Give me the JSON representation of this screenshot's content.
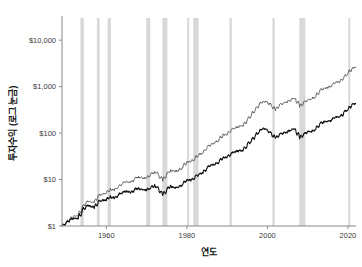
{
  "chart_data": {
    "type": "line",
    "title": "",
    "xlabel": "연도",
    "ylabel": "투자수익 (로그 눈금)",
    "yscale": "log",
    "xlim": [
      1949,
      2022
    ],
    "ylim": [
      1,
      30000
    ],
    "grid": false,
    "legend": "none",
    "y_tick_labels": [
      "$1",
      "$10",
      "$100",
      "$1,000",
      "$10,000"
    ],
    "y_tick_values": [
      1,
      10,
      100,
      1000,
      10000
    ],
    "x_tick_labels": [
      "1960",
      "1980",
      "2000",
      "2020"
    ],
    "x_tick_values": [
      1960,
      1980,
      2000,
      2020
    ],
    "colors": {
      "total_return": "#111111",
      "price_return": "#5a5a5a",
      "recession_band": "#d8d8d8",
      "axis": "#8a8a8a",
      "background": "#ffffff"
    },
    "series": [
      {
        "name": "total-return",
        "color": "#555555",
        "width": 0.9,
        "x": [
          1949.0,
          1950.0,
          1951.0,
          1952.0,
          1953.0,
          1954.0,
          1955.0,
          1956.0,
          1957.0,
          1958.0,
          1959.0,
          1960.0,
          1961.0,
          1962.0,
          1963.0,
          1964.0,
          1965.0,
          1966.0,
          1967.0,
          1968.0,
          1969.0,
          1970.0,
          1971.0,
          1972.0,
          1973.0,
          1974.0,
          1975.0,
          1976.0,
          1977.0,
          1978.0,
          1979.0,
          1980.0,
          1981.0,
          1982.0,
          1983.0,
          1984.0,
          1985.0,
          1986.0,
          1987.0,
          1988.0,
          1989.0,
          1990.0,
          1991.0,
          1992.0,
          1993.0,
          1994.0,
          1995.0,
          1996.0,
          1997.0,
          1998.0,
          1999.0,
          2000.0,
          2001.0,
          2002.0,
          2003.0,
          2004.0,
          2005.0,
          2006.0,
          2007.0,
          2008.0,
          2009.0,
          2010.0,
          2011.0,
          2012.0,
          2013.0,
          2014.0,
          2015.0,
          2016.0,
          2017.0,
          2018.0,
          2019.0,
          2020.0,
          2021.0,
          2021.9
        ],
        "y": [
          1.0,
          1.18,
          1.43,
          1.65,
          1.63,
          2.49,
          3.27,
          3.48,
          3.1,
          4.45,
          4.98,
          5.0,
          6.35,
          5.8,
          7.12,
          8.29,
          9.32,
          8.38,
          10.39,
          11.54,
          10.56,
          10.98,
          12.55,
          14.93,
          12.74,
          9.37,
          12.86,
          15.93,
          14.79,
          15.75,
          18.66,
          24.71,
          23.49,
          28.55,
          34.98,
          37.18,
          48.99,
          58.12,
          61.15,
          71.27,
          93.84,
          90.93,
          118.6,
          127.64,
          140.48,
          142.31,
          195.79,
          240.72,
          320.98,
          412.8,
          499.49,
          454.04,
          400.06,
          311.65,
          401.02,
          444.74,
          466.43,
          540.11,
          569.68,
          358.9,
          453.93,
          522.33,
          533.39,
          618.73,
          818.92,
          930.86,
          943.66,
          1056.48,
          1286.77,
          1230.27,
          1617.28,
          1914.65,
          2463.5,
          2620.0
        ]
      },
      {
        "name": "price-return",
        "color": "#111111",
        "width": 1.1,
        "x": [
          1949.0,
          1950.0,
          1951.0,
          1952.0,
          1953.0,
          1954.0,
          1955.0,
          1956.0,
          1957.0,
          1958.0,
          1959.0,
          1960.0,
          1961.0,
          1962.0,
          1963.0,
          1964.0,
          1965.0,
          1966.0,
          1967.0,
          1968.0,
          1969.0,
          1970.0,
          1971.0,
          1972.0,
          1973.0,
          1974.0,
          1975.0,
          1976.0,
          1977.0,
          1978.0,
          1979.0,
          1980.0,
          1981.0,
          1982.0,
          1983.0,
          1984.0,
          1985.0,
          1986.0,
          1987.0,
          1988.0,
          1989.0,
          1990.0,
          1991.0,
          1992.0,
          1993.0,
          1994.0,
          1995.0,
          1996.0,
          1997.0,
          1998.0,
          1999.0,
          2000.0,
          2001.0,
          2002.0,
          2003.0,
          2004.0,
          2005.0,
          2006.0,
          2007.0,
          2008.0,
          2009.0,
          2010.0,
          2011.0,
          2012.0,
          2013.0,
          2014.0,
          2015.0,
          2016.0,
          2017.0,
          2018.0,
          2019.0,
          2020.0,
          2021.0,
          2021.9
        ],
        "y": [
          1.0,
          1.14,
          1.34,
          1.49,
          1.42,
          2.1,
          2.69,
          2.78,
          2.41,
          3.35,
          3.65,
          3.56,
          4.39,
          3.9,
          4.66,
          5.28,
          5.78,
          5.06,
          6.11,
          6.6,
          5.88,
          5.94,
          6.6,
          7.63,
          6.34,
          4.53,
          6.05,
          7.29,
          6.58,
          6.82,
          7.87,
          10.15,
          9.42,
          11.15,
          13.32,
          13.83,
          17.79,
          20.6,
          21.18,
          24.06,
          30.91,
          29.25,
          37.31,
          39.23,
          42.18,
          41.84,
          56.29,
          67.42,
          87.54,
          109.56,
          129.18,
          114.71,
          98.68,
          75.02,
          94.05,
          101.96,
          104.8,
          119.08,
          123.01,
          76.14,
          94.86,
          106.83,
          106.94,
          121.19,
          157.73,
          176.13,
          175.29,
          192.79,
          230.6,
          216.07,
          279.09,
          324.66,
          411.33,
          434.0
        ]
      }
    ],
    "recession_bands": [
      [
        1953.58,
        1954.42
      ],
      [
        1957.67,
        1958.33
      ],
      [
        1960.33,
        1961.17
      ],
      [
        1969.92,
        1970.92
      ],
      [
        1973.92,
        1975.17
      ],
      [
        1980.08,
        1980.58
      ],
      [
        1981.58,
        1982.92
      ],
      [
        1990.58,
        1991.17
      ],
      [
        2001.25,
        2001.83
      ],
      [
        2007.92,
        2009.42
      ],
      [
        2020.08,
        2020.33
      ]
    ]
  }
}
